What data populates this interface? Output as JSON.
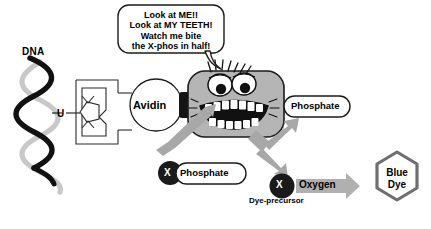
{
  "diagram": {
    "labels": {
      "dna": "DNA",
      "uracil": "U",
      "avidin": "Avidin",
      "phosphate_released": "Phosphate",
      "phosphate_substrate": "Phosphate",
      "x_substrate": "X",
      "x_dye_precursor": "X",
      "oxygen": "Oxygen",
      "dye_precursor": "Dye-precursor",
      "blue_dye": "Blue\nDye",
      "blue_dye_line1": "Blue",
      "blue_dye_line2": "Dye"
    },
    "speech_bubble": {
      "lines": [
        "Look at ME!!",
        "Look at MY TEETH!",
        "Watch me bite",
        "the X-phos in half!"
      ],
      "text": "Look at ME!!\nLook at MY TEETH!\nWatch me bite\nthe X-phos in half!"
    },
    "colors": {
      "background": "#ffffff",
      "outline": "#000000",
      "enzyme_body": "#b5b5b5",
      "enzyme_body_dark": "#9a9a9a",
      "arrow_gray": "#a8a8a8",
      "oxygen_arrow": "#b0b0b0",
      "dna_strand_dark": "#111111",
      "dna_strand_light": "#c3c3c3",
      "hexagon_stroke": "#6f6f6f",
      "x_circle": "#1a1a1a",
      "white": "#ffffff"
    },
    "icons": {
      "dna": "dna-helix-icon",
      "biotin": "biotin-linker-icon",
      "avidin": "avidin-circle-icon",
      "enzyme": "enzyme-monster-icon",
      "speech": "speech-bubble-icon",
      "arrow": "arrow-icon",
      "hexagon": "hexagon-icon"
    }
  }
}
